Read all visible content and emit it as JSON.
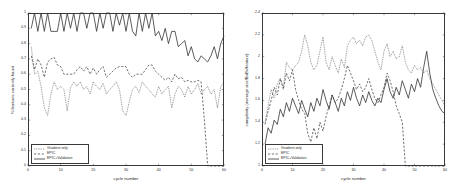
{
  "figure": {
    "background": "#ffffff",
    "line_color": "#333333"
  },
  "legend": {
    "entries": [
      {
        "label": "Gradient only",
        "style": "solid-thin"
      },
      {
        "label": "EPIC",
        "style": "dashed"
      },
      {
        "label": "EPIC+Validation",
        "style": "solid"
      }
    ]
  },
  "chart_data": [
    {
      "type": "line",
      "id": "left",
      "title": "",
      "xlabel": "cycle number",
      "ylabel": "% features correctly found",
      "xlim": [
        0,
        60
      ],
      "ylim": [
        0,
        1
      ],
      "xticks": [
        0,
        10,
        20,
        30,
        40,
        50,
        60
      ],
      "xticklabels": [
        "0",
        "10",
        "20",
        "30",
        "40",
        "50",
        "60"
      ],
      "yticks": [
        0,
        0.1,
        0.2,
        0.3,
        0.4,
        0.5,
        0.6,
        0.7,
        0.8,
        0.9,
        1
      ],
      "yticklabels": [
        "0",
        "0.1",
        "0.2",
        "0.3",
        "0.4",
        "0.5",
        "0.6",
        "0.7",
        "0.8",
        "0.9",
        "1"
      ],
      "grid": false,
      "legend_position": "lower-left",
      "series": [
        {
          "name": "Gradient only",
          "style": "solid-thin",
          "x": [
            1,
            2,
            3,
            4,
            5,
            6,
            7,
            8,
            9,
            10,
            11,
            12,
            13,
            14,
            15,
            16,
            17,
            18,
            19,
            20,
            21,
            22,
            23,
            24,
            25,
            26,
            27,
            28,
            29,
            30,
            31,
            32,
            33,
            34,
            35,
            36,
            37,
            38,
            39,
            40,
            41,
            42,
            43,
            44,
            45,
            46,
            47,
            48,
            49,
            50,
            51,
            52,
            53,
            54,
            55,
            56,
            57,
            58,
            59,
            60
          ],
          "values": [
            0.78,
            0.6,
            0.62,
            0.52,
            0.38,
            0.33,
            0.47,
            0.55,
            0.5,
            0.52,
            0.5,
            0.36,
            0.51,
            0.55,
            0.52,
            0.55,
            0.5,
            0.52,
            0.47,
            0.55,
            0.52,
            0.5,
            0.54,
            0.47,
            0.5,
            0.52,
            0.55,
            0.5,
            0.36,
            0.33,
            0.42,
            0.5,
            0.52,
            0.48,
            0.55,
            0.52,
            0.5,
            0.47,
            0.45,
            0.52,
            0.47,
            0.5,
            0.52,
            0.38,
            0.47,
            0.52,
            0.5,
            0.45,
            0.52,
            0.47,
            0.5,
            0.54,
            0.47,
            0.5,
            0.52,
            0.47,
            0.5,
            0.38,
            0.52,
            0.55
          ]
        },
        {
          "name": "EPIC",
          "style": "dashed",
          "x": [
            1,
            2,
            3,
            4,
            5,
            6,
            7,
            8,
            9,
            10,
            11,
            12,
            13,
            14,
            15,
            16,
            17,
            18,
            19,
            20,
            21,
            22,
            23,
            24,
            25,
            26,
            27,
            28,
            29,
            30,
            31,
            32,
            33,
            34,
            35,
            36,
            37,
            38,
            39,
            40,
            41,
            42,
            43,
            44,
            45,
            46,
            47,
            48,
            49,
            50,
            51,
            52,
            53,
            54,
            55,
            56,
            57,
            58,
            59,
            60
          ],
          "values": [
            0.72,
            0.63,
            0.7,
            0.66,
            0.58,
            0.68,
            0.7,
            0.71,
            0.66,
            0.65,
            0.6,
            0.6,
            0.6,
            0.6,
            0.63,
            0.65,
            0.62,
            0.65,
            0.6,
            0.64,
            0.6,
            0.63,
            0.65,
            0.58,
            0.6,
            0.62,
            0.64,
            0.65,
            0.65,
            0.65,
            0.6,
            0.58,
            0.6,
            0.6,
            0.6,
            0.63,
            0.66,
            0.66,
            0.62,
            0.6,
            0.58,
            0.56,
            0.58,
            0.55,
            0.6,
            0.57,
            0.58,
            0.55,
            0.56,
            0.55,
            0.55,
            0.56,
            0.55,
            0.3,
            0.0,
            0.0,
            0.0,
            0.0,
            0.0,
            0.0
          ]
        },
        {
          "name": "EPIC+Validation",
          "style": "solid",
          "x": [
            1,
            2,
            3,
            4,
            5,
            6,
            7,
            8,
            9,
            10,
            11,
            12,
            13,
            14,
            15,
            16,
            17,
            18,
            19,
            20,
            21,
            22,
            23,
            24,
            25,
            26,
            27,
            28,
            29,
            30,
            31,
            32,
            33,
            34,
            35,
            36,
            37,
            38,
            39,
            40,
            41,
            42,
            43,
            44,
            45,
            46,
            47,
            48,
            49,
            50,
            51,
            52,
            53,
            54,
            55,
            56,
            57,
            58,
            59,
            60
          ],
          "values": [
            0.9,
            1.0,
            0.88,
            1.0,
            0.88,
            1.0,
            0.88,
            0.88,
            0.88,
            1.0,
            0.88,
            1.0,
            0.9,
            1.0,
            0.88,
            1.0,
            1.0,
            0.9,
            1.0,
            1.0,
            0.88,
            1.0,
            0.9,
            1.0,
            1.0,
            0.88,
            1.0,
            0.92,
            1.0,
            0.88,
            1.0,
            0.88,
            0.85,
            1.0,
            0.88,
            1.0,
            0.9,
            1.0,
            0.85,
            0.88,
            0.82,
            0.9,
            0.8,
            0.88,
            0.88,
            0.78,
            0.8,
            0.82,
            0.72,
            0.78,
            0.7,
            0.68,
            0.72,
            0.7,
            0.68,
            0.72,
            0.78,
            0.7,
            0.8,
            0.85
          ]
        }
      ]
    },
    {
      "type": "line",
      "id": "right",
      "title": "",
      "xlabel": "cycle number",
      "ylabel": "complexity (average size/BoBs/feature)",
      "xlim": [
        0,
        60
      ],
      "ylim": [
        1,
        2.4
      ],
      "xticks": [
        0,
        10,
        20,
        30,
        40,
        50,
        60
      ],
      "xticklabels": [
        "0",
        "10",
        "20",
        "30",
        "40",
        "50",
        "60"
      ],
      "yticks": [
        1,
        1.2,
        1.4,
        1.6,
        1.8,
        2,
        2.2,
        2.4
      ],
      "yticklabels": [
        "1",
        "1.2",
        "1.4",
        "1.6",
        "1.8",
        "2",
        "2.2",
        "2.4"
      ],
      "grid": false,
      "legend_position": "lower-left",
      "series": [
        {
          "name": "Gradient only",
          "style": "solid-thin",
          "x": [
            1,
            2,
            3,
            4,
            5,
            6,
            7,
            8,
            9,
            10,
            11,
            12,
            13,
            14,
            15,
            16,
            17,
            18,
            19,
            20,
            21,
            22,
            23,
            24,
            25,
            26,
            27,
            28,
            29,
            30,
            31,
            32,
            33,
            34,
            35,
            36,
            37,
            38,
            39,
            40,
            41,
            42,
            43,
            44,
            45,
            46,
            47,
            48,
            49,
            50,
            51,
            52,
            53,
            54,
            55,
            56,
            57,
            58,
            59,
            60
          ],
          "values": [
            1.4,
            1.55,
            1.7,
            1.62,
            1.75,
            1.8,
            1.72,
            1.95,
            1.9,
            1.88,
            1.92,
            1.95,
            2.05,
            2.2,
            2.1,
            1.95,
            1.88,
            1.92,
            2.05,
            2.18,
            1.95,
            1.88,
            2.0,
            1.92,
            1.85,
            1.98,
            1.9,
            2.1,
            2.15,
            2.18,
            2.12,
            2.15,
            2.1,
            2.18,
            2.2,
            2.15,
            2.05,
            1.95,
            1.88,
            2.05,
            2.12,
            2.0,
            2.05,
            1.98,
            2.0,
            2.1,
            1.95,
            1.88,
            1.85,
            1.92,
            1.88,
            1.9,
            1.85,
            1.88,
            1.8,
            1.75,
            1.7,
            1.65,
            1.6,
            1.55
          ]
        },
        {
          "name": "EPIC",
          "style": "dashed",
          "x": [
            1,
            2,
            3,
            4,
            5,
            6,
            7,
            8,
            9,
            10,
            11,
            12,
            13,
            14,
            15,
            16,
            17,
            18,
            19,
            20,
            21,
            22,
            23,
            24,
            25,
            26,
            27,
            28,
            29,
            30,
            31,
            32,
            33,
            34,
            35,
            36,
            37,
            38,
            39,
            40,
            41,
            42,
            43,
            44,
            45,
            46,
            47,
            48,
            49,
            50,
            51,
            52,
            53,
            54,
            55,
            56,
            57,
            58,
            59,
            60
          ],
          "values": [
            1.38,
            1.5,
            1.6,
            1.72,
            1.65,
            1.8,
            1.7,
            1.85,
            1.78,
            1.88,
            1.7,
            1.6,
            1.52,
            1.48,
            1.3,
            1.22,
            1.35,
            1.25,
            1.4,
            1.32,
            1.45,
            1.55,
            1.65,
            1.58,
            1.62,
            1.7,
            1.8,
            1.92,
            1.85,
            1.78,
            1.7,
            1.75,
            1.68,
            1.72,
            1.8,
            1.7,
            1.62,
            1.58,
            1.65,
            1.72,
            1.85,
            1.78,
            1.68,
            1.55,
            1.48,
            1.4,
            1.0,
            1.0,
            1.0,
            1.0,
            1.0,
            1.0,
            1.0,
            1.0,
            1.0,
            1.0,
            1.0,
            1.0,
            1.0,
            1.0
          ]
        },
        {
          "name": "EPIC+Validation",
          "style": "solid",
          "x": [
            1,
            2,
            3,
            4,
            5,
            6,
            7,
            8,
            9,
            10,
            11,
            12,
            13,
            14,
            15,
            16,
            17,
            18,
            19,
            20,
            21,
            22,
            23,
            24,
            25,
            26,
            27,
            28,
            29,
            30,
            31,
            32,
            33,
            34,
            35,
            36,
            37,
            38,
            39,
            40,
            41,
            42,
            43,
            44,
            45,
            46,
            47,
            48,
            49,
            50,
            51,
            52,
            53,
            54,
            55,
            56,
            57,
            58,
            59,
            60
          ],
          "values": [
            1.2,
            1.35,
            1.3,
            1.42,
            1.38,
            1.52,
            1.45,
            1.58,
            1.5,
            1.62,
            1.55,
            1.48,
            1.6,
            1.52,
            1.45,
            1.58,
            1.5,
            1.62,
            1.55,
            1.7,
            1.6,
            1.52,
            1.65,
            1.58,
            1.5,
            1.62,
            1.55,
            1.68,
            1.6,
            1.72,
            1.62,
            1.55,
            1.65,
            1.58,
            1.68,
            1.6,
            1.55,
            1.62,
            1.58,
            1.7,
            1.8,
            1.68,
            1.62,
            1.72,
            1.65,
            1.78,
            1.7,
            1.62,
            1.75,
            1.68,
            1.8,
            1.72,
            1.9,
            2.05,
            1.85,
            1.7,
            1.62,
            1.55,
            1.5,
            1.48
          ]
        }
      ]
    }
  ]
}
